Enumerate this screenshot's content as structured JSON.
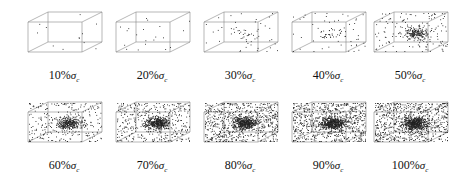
{
  "figure": {
    "panels": [
      {
        "label": "10%",
        "symbol": "σ",
        "subscript": "c",
        "density": 12,
        "cluster": 0.0
      },
      {
        "label": "20%",
        "symbol": "σ",
        "subscript": "c",
        "density": 20,
        "cluster": 0.0
      },
      {
        "label": "30%",
        "symbol": "σ",
        "subscript": "c",
        "density": 60,
        "cluster": 0.3
      },
      {
        "label": "40%",
        "symbol": "σ",
        "subscript": "c",
        "density": 80,
        "cluster": 0.3
      },
      {
        "label": "50%",
        "symbol": "σ",
        "subscript": "c",
        "density": 320,
        "cluster": 0.6
      },
      {
        "label": "60%",
        "symbol": "σ",
        "subscript": "c",
        "density": 550,
        "cluster": 0.5
      },
      {
        "label": "70%",
        "symbol": "σ",
        "subscript": "c",
        "density": 800,
        "cluster": 0.5
      },
      {
        "label": "80%",
        "symbol": "σ",
        "subscript": "c",
        "density": 1100,
        "cluster": 0.4
      },
      {
        "label": "90%",
        "symbol": "σ",
        "subscript": "c",
        "density": 1200,
        "cluster": 0.4
      },
      {
        "label": "100%",
        "symbol": "σ",
        "subscript": "c",
        "density": 1200,
        "cluster": 0.4
      }
    ]
  },
  "chart_data": {
    "type": "scatter",
    "title": "",
    "categories": [
      "10%σc",
      "20%σc",
      "30%σc",
      "40%σc",
      "50%σc",
      "60%σc",
      "70%σc",
      "80%σc",
      "90%σc",
      "100%σc"
    ],
    "relative_event_density": [
      12,
      20,
      60,
      80,
      320,
      550,
      800,
      1100,
      1200,
      1200
    ],
    "grid": false,
    "legend": "none"
  }
}
